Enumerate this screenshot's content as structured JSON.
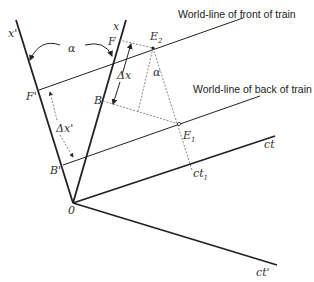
{
  "diagram": {
    "type": "spacetime-diagram",
    "labels": {
      "x_prime_axis": "x'",
      "x_axis": "x",
      "ct_axis": "ct",
      "ct_prime_axis": "ct'",
      "origin": "0",
      "alpha_top": "α",
      "alpha_mid": "α",
      "F": "F",
      "F_prime": "F'",
      "B": "B",
      "B_prime": "B'",
      "E1": "E",
      "E1_sub": "1",
      "E2": "E",
      "E2_sub": "2",
      "delta_x": "Δx",
      "delta_x_prime": "Δx'",
      "ct1": "ct",
      "ct1_sub": "1"
    },
    "annotations": {
      "front": "World-line of front of train",
      "back": "World-line of back of train"
    }
  }
}
